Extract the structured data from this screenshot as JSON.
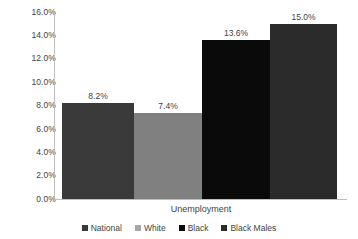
{
  "chart_data": {
    "type": "bar",
    "title": "",
    "xlabel": "Unemployment",
    "ylabel": "",
    "categories": [
      "National",
      "White",
      "Black",
      "Black Males"
    ],
    "values": [
      8.2,
      7.4,
      13.6,
      15.0
    ],
    "data_labels": [
      "8.2%",
      "7.4%",
      "13.6%",
      "15.0%"
    ],
    "ylim": [
      0,
      16
    ],
    "ytick_values": [
      16.0,
      14.0,
      12.0,
      10.0,
      8.0,
      6.0,
      4.0,
      2.0,
      0.0
    ],
    "ytick_labels": [
      "16.0%",
      "14.0%",
      "12.0%",
      "10.0%",
      "8.0%",
      "6.0%",
      "4.0%",
      "2.0%",
      "0.0%"
    ],
    "grid": false,
    "legend_position": "bottom",
    "series_colors": [
      "#3a3a3a",
      "#808080",
      "#0a0a0a",
      "#2b2b2b"
    ],
    "axis_color": "#bfbfbf",
    "text_color": "#3f3f3f",
    "background": "#ffffff"
  },
  "legend": {
    "items": [
      {
        "label": "National",
        "color": "#3a3a3a"
      },
      {
        "label": "White",
        "color": "#a6a6a6"
      },
      {
        "label": "Black",
        "color": "#0a0a0a"
      },
      {
        "label": "Black Males",
        "color": "#2b2b2b"
      }
    ]
  }
}
